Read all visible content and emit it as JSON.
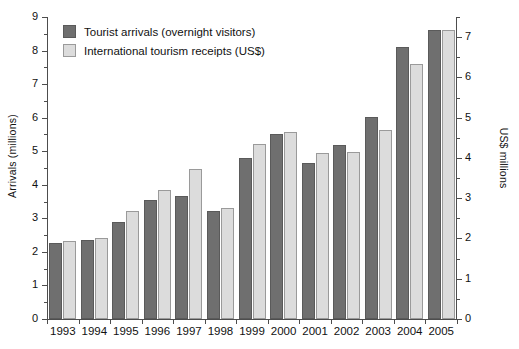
{
  "chart_data": {
    "type": "bar",
    "title": "",
    "xlabel": "",
    "ylabel": "Arrivals (millions)",
    "y2label": "US$ millions",
    "categories": [
      "1993",
      "1994",
      "1995",
      "1996",
      "1997",
      "1998",
      "1999",
      "2000",
      "2001",
      "2002",
      "2003",
      "2004",
      "2005"
    ],
    "ylim": [
      0,
      9
    ],
    "y2lim": [
      0,
      7.5
    ],
    "yticks": [
      0,
      1,
      2,
      3,
      4,
      5,
      6,
      7,
      8,
      9
    ],
    "y2ticks": [
      0,
      1,
      2,
      3,
      4,
      5,
      6,
      7
    ],
    "grid": false,
    "legend_position": "top-left",
    "series": [
      {
        "name": "Tourist arrivals (overnight visitors)",
        "axis": "left",
        "unit": "millions",
        "color": "#6f6f6f",
        "values": [
          2.28,
          2.35,
          2.88,
          3.55,
          3.68,
          3.23,
          4.8,
          5.5,
          4.65,
          5.19,
          6.03,
          8.11,
          8.61
        ]
      },
      {
        "name": "International tourism receipts (US$)",
        "axis": "right",
        "unit": "US$ millions",
        "color": "#dcdcdc",
        "values": [
          1.93,
          2.01,
          2.69,
          3.21,
          3.73,
          2.76,
          4.35,
          4.65,
          4.12,
          4.14,
          4.7,
          6.33,
          7.18
        ]
      }
    ]
  },
  "legend": {
    "items": [
      {
        "label": "Tourist arrivals (overnight visitors)",
        "swatch": "dark"
      },
      {
        "label": "International tourism receipts (US$)",
        "swatch": "light"
      }
    ]
  }
}
